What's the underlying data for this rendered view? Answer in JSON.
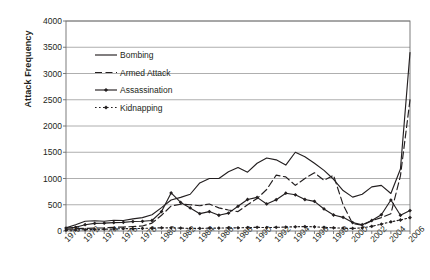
{
  "chart_data": {
    "type": "line",
    "title": "",
    "subtitle": "",
    "xlabel": "",
    "ylabel": "Attack Frequency",
    "xlim": [
      1970,
      2006
    ],
    "ylim": [
      0,
      4000
    ],
    "ytick_step": 500,
    "ytick_labels": [
      "0",
      "500",
      "1000",
      "1500",
      "2000",
      "2500",
      "3000",
      "3500",
      "4000"
    ],
    "xtick_labels": [
      "1970",
      "1972",
      "1974",
      "1976",
      "1978",
      "1980",
      "1982",
      "1984",
      "1986",
      "1988",
      "1990",
      "1992",
      "1994",
      "1996",
      "1998",
      "2000",
      "2002",
      "2004",
      "2006"
    ],
    "xtick_step": 2,
    "grid": "horizontal",
    "legend_position": "inside-upper-left",
    "x": [
      1970,
      1971,
      1972,
      1973,
      1974,
      1975,
      1976,
      1977,
      1978,
      1979,
      1980,
      1981,
      1982,
      1983,
      1984,
      1985,
      1986,
      1987,
      1988,
      1989,
      1990,
      1991,
      1992,
      1993,
      1994,
      1995,
      1996,
      1997,
      1998,
      1999,
      2000,
      2001,
      2002,
      2003,
      2004,
      2005,
      2006
    ],
    "series": [
      {
        "name": "Bombing",
        "style": "solid",
        "marker": "none",
        "color": "#231f20",
        "values": [
          60,
          120,
          185,
          195,
          185,
          205,
          200,
          230,
          255,
          310,
          445,
          590,
          640,
          700,
          915,
          1000,
          1000,
          1130,
          1210,
          1120,
          1290,
          1390,
          1355,
          1255,
          1500,
          1415,
          1290,
          1155,
          985,
          770,
          645,
          700,
          840,
          870,
          715,
          1180,
          3400
        ]
      },
      {
        "name": "Armed Attack",
        "style": "dashed",
        "marker": "none",
        "color": "#231f20",
        "values": [
          30,
          45,
          50,
          55,
          60,
          70,
          75,
          85,
          95,
          150,
          300,
          475,
          510,
          500,
          480,
          515,
          440,
          400,
          370,
          500,
          620,
          790,
          1065,
          1030,
          870,
          1000,
          1110,
          965,
          1060,
          500,
          140,
          110,
          195,
          255,
          330,
          1050,
          2500
        ]
      },
      {
        "name": "Assassination",
        "style": "solid",
        "marker": "diamond",
        "color": "#231f20",
        "values": [
          55,
          70,
          120,
          145,
          150,
          160,
          165,
          180,
          185,
          200,
          370,
          725,
          545,
          440,
          330,
          370,
          300,
          340,
          470,
          600,
          640,
          515,
          595,
          720,
          690,
          600,
          565,
          420,
          305,
          260,
          160,
          120,
          200,
          310,
          590,
          300,
          390
        ]
      },
      {
        "name": "Kidnapping",
        "style": "dotted",
        "marker": "diamond",
        "color": "#231f20",
        "values": [
          15,
          20,
          25,
          30,
          35,
          40,
          45,
          45,
          50,
          55,
          60,
          60,
          55,
          50,
          50,
          55,
          55,
          60,
          60,
          65,
          70,
          65,
          70,
          75,
          80,
          85,
          80,
          70,
          60,
          55,
          50,
          60,
          90,
          130,
          175,
          210,
          255
        ]
      }
    ],
    "legend": [
      {
        "label": "Bombing",
        "style": "solid",
        "marker": "none"
      },
      {
        "label": "Armed Attack",
        "style": "dashed",
        "marker": "none"
      },
      {
        "label": "Assassination",
        "style": "solid",
        "marker": "diamond"
      },
      {
        "label": "Kidnapping",
        "style": "dotted",
        "marker": "diamond"
      }
    ]
  }
}
